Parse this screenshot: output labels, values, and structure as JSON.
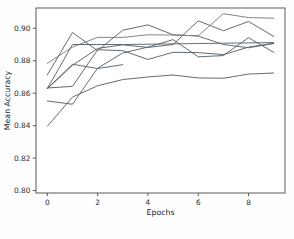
{
  "chart_data": {
    "type": "line",
    "title": "",
    "xlabel": "Epochs",
    "ylabel": "Mean Accuracy",
    "xlim": [
      -0.45,
      9.45
    ],
    "ylim": [
      0.7985,
      0.9125
    ],
    "grid": false,
    "legend": null,
    "legend_position": "none",
    "xticks": [
      0,
      2,
      4,
      6,
      8
    ],
    "xtick_labels": [
      "0",
      "2",
      "4",
      "6",
      "8"
    ],
    "yticks": [
      0.8,
      0.82,
      0.84,
      0.86,
      0.88,
      0.9
    ],
    "ytick_labels": [
      "0.80",
      "0.82",
      "0.84",
      "0.86",
      "0.88",
      "0.90"
    ],
    "x": [
      0,
      1,
      2,
      3,
      4,
      5,
      6,
      7,
      8,
      9
    ],
    "line_color": "#555f66",
    "series": [
      {
        "name": "fold-1",
        "color": "#5a646b",
        "x": [
          0,
          1,
          2,
          3,
          4,
          5,
          6,
          7,
          8,
          9
        ],
        "values": [
          0.8628,
          0.8772,
          0.8876,
          0.8898,
          0.8882,
          0.89,
          0.9046,
          0.8985,
          0.9042,
          0.895
        ]
      },
      {
        "name": "fold-2",
        "color": "#5a646b",
        "x": [
          0,
          1,
          2,
          3,
          4,
          5,
          6,
          7,
          8,
          9
        ],
        "values": [
          0.8713,
          0.8974,
          0.8862,
          0.8988,
          0.9021,
          0.896,
          0.8952,
          0.89,
          0.888,
          0.8906
        ]
      },
      {
        "name": "fold-3",
        "color": "#767f86",
        "x": [
          0,
          1,
          2,
          3,
          4,
          5,
          6,
          7,
          8,
          9
        ],
        "values": [
          0.8784,
          0.8884,
          0.8944,
          0.8944,
          0.896,
          0.8958,
          0.8954,
          0.909,
          0.9066,
          0.9062
        ]
      },
      {
        "name": "fold-4",
        "color": "#5a646b",
        "x": [
          0,
          1,
          2,
          3,
          4,
          5,
          6,
          7,
          8,
          9
        ],
        "values": [
          0.8628,
          0.89,
          0.89,
          0.89,
          0.8902,
          0.8904,
          0.8906,
          0.8908,
          0.891,
          0.8912
        ]
      },
      {
        "name": "fold-5",
        "color": "#5a646b",
        "x": [
          0,
          1,
          2,
          3,
          4,
          5,
          6,
          7,
          8,
          9
        ],
        "values": [
          0.8552,
          0.8532,
          0.8754,
          0.8848,
          0.8884,
          0.893,
          0.8824,
          0.8832,
          0.8942,
          0.8852
        ]
      },
      {
        "name": "fold-6",
        "color": "#5a646b",
        "x": [
          0,
          1,
          2,
          3,
          4,
          5,
          6,
          7,
          8,
          9
        ],
        "values": [
          0.8632,
          0.8642,
          0.8868,
          0.8862,
          0.8808,
          0.8852,
          0.885,
          0.8838,
          0.8884,
          0.8908
        ]
      },
      {
        "name": "fold-7",
        "color": "#5a646b",
        "x": [
          0,
          1,
          2,
          3
        ],
        "values": [
          0.8628,
          0.8778,
          0.8752,
          0.8776
        ]
      },
      {
        "name": "fold-8",
        "color": "#5a646b",
        "x": [
          0,
          1,
          2,
          3,
          4,
          5,
          6,
          7,
          8,
          9
        ],
        "values": [
          0.8396,
          0.8576,
          0.8646,
          0.8684,
          0.87,
          0.8712,
          0.8694,
          0.8692,
          0.8718,
          0.8724
        ]
      }
    ]
  },
  "axes": {
    "x_axis_label": "Epochs",
    "y_axis_label": "Mean Accuracy"
  }
}
